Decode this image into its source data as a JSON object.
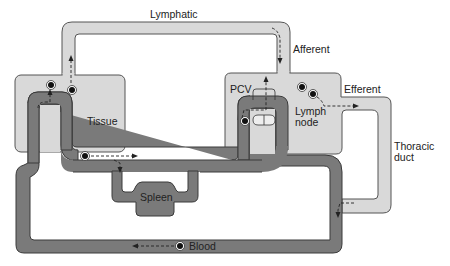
{
  "labels": {
    "lymphatic": "Lymphatic",
    "afferent": "Afferent",
    "efferent": "Efferent",
    "tissue": "Tissue",
    "pcv": "PCV",
    "lymph_node_line1": "Lymph",
    "lymph_node_line2": "node",
    "thoracic_line1": "Thoracic",
    "thoracic_line2": "duct",
    "spleen": "Spleen",
    "blood": "Blood"
  },
  "colors": {
    "lymph_fill": "#d9d9d9",
    "lymph_stroke": "#555555",
    "blood_fill": "#7a7a7a",
    "blood_stroke": "#3a3a3a",
    "cell": "#111111",
    "arrow": "#222222"
  }
}
